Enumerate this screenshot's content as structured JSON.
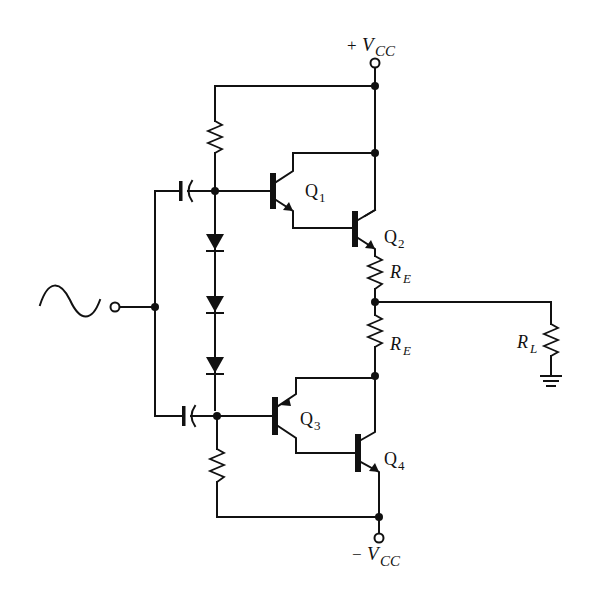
{
  "diagram": {
    "type": "circuit-schematic",
    "labels": {
      "vcc_pos": {
        "sign": "+",
        "main": "V",
        "sub": "CC"
      },
      "vcc_neg": {
        "sign": "−",
        "main": "V",
        "sub": "CC"
      },
      "q1": {
        "main": "Q",
        "sub": "1"
      },
      "q2": {
        "main": "Q",
        "sub": "2"
      },
      "q3": {
        "main": "Q",
        "sub": "3"
      },
      "q4": {
        "main": "Q",
        "sub": "4"
      },
      "re_top": {
        "main": "R",
        "sub": "E"
      },
      "re_bottom": {
        "main": "R",
        "sub": "E"
      },
      "rl": {
        "main": "R",
        "sub": "L"
      }
    },
    "components": [
      {
        "id": "source",
        "kind": "ac-voltage-source"
      },
      {
        "id": "C1",
        "kind": "capacitor",
        "position": "upper-input"
      },
      {
        "id": "C2",
        "kind": "capacitor",
        "position": "lower-input"
      },
      {
        "id": "R_bias_top",
        "kind": "resistor"
      },
      {
        "id": "R_bias_bottom",
        "kind": "resistor"
      },
      {
        "id": "D1",
        "kind": "diode"
      },
      {
        "id": "D2",
        "kind": "diode"
      },
      {
        "id": "D3",
        "kind": "diode"
      },
      {
        "id": "Q1",
        "kind": "npn-transistor"
      },
      {
        "id": "Q2",
        "kind": "npn-transistor"
      },
      {
        "id": "Q3",
        "kind": "pnp-transistor"
      },
      {
        "id": "Q4",
        "kind": "npn-transistor"
      },
      {
        "id": "RE_top",
        "kind": "resistor"
      },
      {
        "id": "RE_bottom",
        "kind": "resistor"
      },
      {
        "id": "RL",
        "kind": "resistor"
      },
      {
        "id": "ground",
        "kind": "ground"
      }
    ],
    "colors": {
      "ink": "#111111",
      "background": "#ffffff"
    }
  }
}
